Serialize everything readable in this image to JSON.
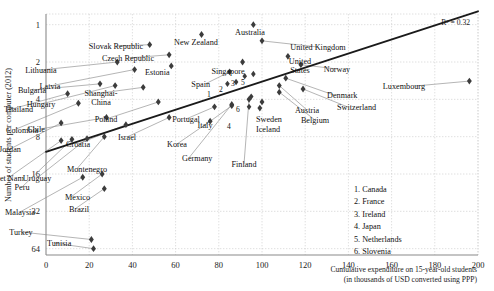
{
  "chart_data": {
    "type": "scatter",
    "title": "",
    "xlabel": "Cumulative expenditure on 15-year-old students (in thousands of USD converted using PPP)",
    "xlabel_line1": "Cumulative expenditure on 15-year-old students",
    "xlabel_line2": "(in thousands of USD converted using PPP)",
    "ylabel": "Number of students per computer (2012)",
    "xlim": [
      0,
      200
    ],
    "ylim_log2": [
      1,
      64
    ],
    "yscale": "log2 (inverted, 1 at top)",
    "grid": true,
    "xticks": [
      0,
      20,
      40,
      60,
      80,
      100,
      120,
      140,
      160,
      180,
      200
    ],
    "yticks": [
      1,
      2,
      4,
      8,
      16,
      32,
      64
    ],
    "annotation_r2": "R² = 0.32",
    "r2_value": 0.32,
    "trendline": {
      "x0": 0,
      "y0": 10.6,
      "x1": 200,
      "y1": 0.78
    },
    "points": [
      {
        "label": "Viet Nam",
        "x": 7,
        "y": 8.6,
        "lx": 8,
        "ly": 181,
        "anchor": "middle"
      },
      {
        "label": "Jordan",
        "x": 7,
        "y": 6.2,
        "lx": 10,
        "ly": 152,
        "anchor": "middle"
      },
      {
        "label": "Thailand",
        "x": 10,
        "y": 3.6,
        "lx": 4,
        "ly": 112,
        "anchor": "start"
      },
      {
        "label": "Colombia",
        "x": 15,
        "y": 4.3,
        "lx": 6,
        "ly": 133,
        "anchor": "start"
      },
      {
        "label": "Peru",
        "x": 12,
        "y": 8.4,
        "lx": 22,
        "ly": 190,
        "anchor": "middle"
      },
      {
        "label": "Malaysia",
        "x": 17,
        "y": 17,
        "lx": 20,
        "ly": 215,
        "anchor": "middle"
      },
      {
        "label": "Uruguay",
        "x": 19,
        "y": 8.3,
        "lx": 37,
        "ly": 181,
        "anchor": "middle"
      },
      {
        "label": "Turkey",
        "x": 21,
        "y": 54,
        "lx": 21,
        "ly": 235,
        "anchor": "middle"
      },
      {
        "label": "Tunisia",
        "x": 22,
        "y": 64,
        "lx": 47,
        "ly": 246,
        "anchor": "start"
      },
      {
        "label": "Bulgaria",
        "x": 25,
        "y": 3.0,
        "lx": 32,
        "ly": 93,
        "anchor": "middle"
      },
      {
        "label": "Chile",
        "x": 28,
        "y": 5.6,
        "lx": 45,
        "ly": 132,
        "anchor": "end"
      },
      {
        "label": "Mexico",
        "x": 26,
        "y": 16,
        "lx": 65,
        "ly": 200,
        "anchor": "start"
      },
      {
        "label": "Montenegro",
        "x": 27,
        "y": 8.0,
        "lx": 67,
        "ly": 172,
        "anchor": "start"
      },
      {
        "label": "Brazil",
        "x": 27,
        "y": 21,
        "lx": 69,
        "ly": 212,
        "anchor": "start"
      },
      {
        "label": "Lithuania",
        "x": 33,
        "y": 2.0,
        "lx": 41,
        "ly": 73,
        "anchor": "middle"
      },
      {
        "label": "Hungary",
        "x": 32,
        "y": 3.1,
        "lx": 41,
        "ly": 107,
        "anchor": "middle"
      },
      {
        "label": "Croatia",
        "x": 37,
        "y": 6.4,
        "lx": 78,
        "ly": 147,
        "anchor": "middle"
      },
      {
        "label": "Latvia",
        "x": 41,
        "y": 2.3,
        "lx": 50,
        "ly": 89,
        "anchor": "middle"
      },
      {
        "label": "Slovak Republic",
        "x": 48,
        "y": 1.45,
        "lx": 116,
        "ly": 49,
        "anchor": "middle"
      },
      {
        "label": "Shanghai-China",
        "x": 45,
        "y": 3.2,
        "lx": 101,
        "ly": 96,
        "anchor": "middle"
      },
      {
        "label": "Poland",
        "x": 52,
        "y": 4.2,
        "lx": 106,
        "ly": 122,
        "anchor": "middle"
      },
      {
        "label": "Czech Republic",
        "x": 57,
        "y": 1.75,
        "lx": 128,
        "ly": 61,
        "anchor": "middle"
      },
      {
        "label": "Estonia",
        "x": 58,
        "y": 2.15,
        "lx": 145,
        "ly": 75,
        "anchor": "start"
      },
      {
        "label": "Israel",
        "x": 57,
        "y": 5.6,
        "lx": 127,
        "ly": 140,
        "anchor": "middle"
      },
      {
        "label": "New Zealand",
        "x": 72,
        "y": 1.2,
        "lx": 196,
        "ly": 45,
        "anchor": "middle"
      },
      {
        "label": "Portugal",
        "x": 78,
        "y": 4.6,
        "lx": 186,
        "ly": 122,
        "anchor": "middle"
      },
      {
        "label": "Korea",
        "x": 76,
        "y": 6.0,
        "lx": 177,
        "ly": 147,
        "anchor": "middle"
      },
      {
        "label": "Germany",
        "x": 86,
        "y": 4.4,
        "lx": 182,
        "ly": 161,
        "anchor": "start"
      },
      {
        "label": "Spain",
        "x": 85,
        "y": 2.4,
        "lx": 210,
        "ly": 87,
        "anchor": "end"
      },
      {
        "label": "Singapore",
        "x": 91,
        "y": 2.0,
        "lx": 228,
        "ly": 74,
        "anchor": "middle"
      },
      {
        "label": "Italy",
        "x": 86,
        "y": 4.5,
        "lx": 205,
        "ly": 128,
        "anchor": "middle"
      },
      {
        "label": "Finland",
        "x": 94,
        "y": 4.0,
        "lx": 244,
        "ly": 167,
        "anchor": "middle"
      },
      {
        "label": "Sweden",
        "x": 100,
        "y": 4.2,
        "lx": 256,
        "ly": 122,
        "anchor": "start"
      },
      {
        "label": "Iceland",
        "x": 99,
        "y": 4.7,
        "lx": 256,
        "ly": 132,
        "anchor": "start"
      },
      {
        "label": "Australia",
        "x": 96,
        "y": 1.0,
        "lx": 250,
        "ly": 35,
        "anchor": "middle"
      },
      {
        "label": "United Kingdom",
        "x": 100,
        "y": 1.35,
        "lx": 318,
        "ly": 50,
        "anchor": "middle"
      },
      {
        "label": "United States",
        "x": 112,
        "y": 1.8,
        "lx": 300,
        "ly": 64,
        "anchor": "middle"
      },
      {
        "label": "Norway",
        "x": 118,
        "y": 2.1,
        "lx": 337,
        "ly": 72,
        "anchor": "middle"
      },
      {
        "label": "Denmark",
        "x": 111,
        "y": 2.7,
        "lx": 327,
        "ly": 98,
        "anchor": "start"
      },
      {
        "label": "Austria",
        "x": 108,
        "y": 3.1,
        "lx": 307,
        "ly": 113,
        "anchor": "middle"
      },
      {
        "label": "Belgium",
        "x": 108,
        "y": 3.5,
        "lx": 315,
        "ly": 123,
        "anchor": "middle"
      },
      {
        "label": "Switzerland",
        "x": 119,
        "y": 3.3,
        "lx": 337,
        "ly": 110,
        "anchor": "start"
      },
      {
        "label": "Luxembourg",
        "x": 196,
        "y": 2.85,
        "lx": 425,
        "ly": 89,
        "anchor": "end"
      }
    ],
    "numbered_points": [
      {
        "n": "1",
        "label": "Canada",
        "x": 84,
        "y": 3.0,
        "lx": 209,
        "ly": 97
      },
      {
        "n": "2",
        "label": "France",
        "x": 88,
        "y": 2.9,
        "lx": 221,
        "ly": 92
      },
      {
        "n": "3",
        "label": "Ireland",
        "x": 92,
        "y": 2.6,
        "lx": 233,
        "ly": 86
      },
      {
        "n": "4",
        "label": "Japan",
        "x": 94,
        "y": 4.6,
        "lx": 229,
        "ly": 129
      },
      {
        "n": "5",
        "label": "Netherlands",
        "x": 96,
        "y": 2.5,
        "lx": 243,
        "ly": 85
      },
      {
        "n": "6",
        "label": "Slovenia",
        "x": 95,
        "y": 3.8,
        "lx": 238,
        "ly": 112
      }
    ],
    "legend": {
      "position": "bottom-right",
      "entries": [
        "1. Canada",
        "2. France",
        "3. Ireland",
        "4. Japan",
        "5. Netherlands",
        "6. Slovenia"
      ]
    }
  }
}
